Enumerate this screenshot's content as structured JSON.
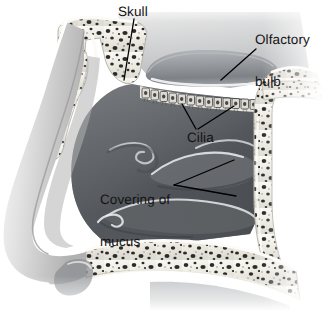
{
  "figure": {
    "type": "anatomical-illustration",
    "width": 323,
    "height": 311,
    "background_color": "#ffffff",
    "style": "grayscale medical illustration, sagittal section of the human nose"
  },
  "labels": {
    "skull": "Skull",
    "olfactory_bulb_line1": "Olfactory",
    "olfactory_bulb_line2": "bulb",
    "cilia": "Cilia",
    "mucus_line1": "Covering of",
    "mucus_line2": "mucus"
  },
  "colors": {
    "label_text": "#141414",
    "leader_line": "#000000",
    "bone_fill": "#efece4",
    "bone_speckle": "#2e2e2e",
    "cavity_dark": "#5e6064",
    "cavity_mid": "#7d8084",
    "skin_light": "#d9d9d9",
    "highlight": "#f2f2f2",
    "bulb_fill": "#8f9296"
  },
  "structures": [
    {
      "name": "skull-bone-sinus-upper-left",
      "description": "frontal sinus trabecular bone, upper left"
    },
    {
      "name": "skull-bone-right-wall",
      "description": "Y-shaped bone wall, right side"
    },
    {
      "name": "skull-bone-palate",
      "description": "hard palate trabecular bone, lower"
    },
    {
      "name": "olfactory-bulb",
      "description": "elongated ellipse above the cribriform plate"
    },
    {
      "name": "cilia-row",
      "description": "row of olfactory receptor cells along the cribriform plate",
      "cell_count": 14
    },
    {
      "name": "nasal-cavity",
      "description": "dark open airway"
    },
    {
      "name": "turbinate-superior",
      "description": "upper nasal concha fold"
    },
    {
      "name": "turbinate-middle",
      "description": "middle nasal concha fold"
    },
    {
      "name": "turbinate-inferior",
      "description": "lower nasal concha fold"
    },
    {
      "name": "nose-profile",
      "description": "external skin profile of the nose, left edge"
    },
    {
      "name": "nostril",
      "description": "nostril opening, lower left"
    }
  ]
}
